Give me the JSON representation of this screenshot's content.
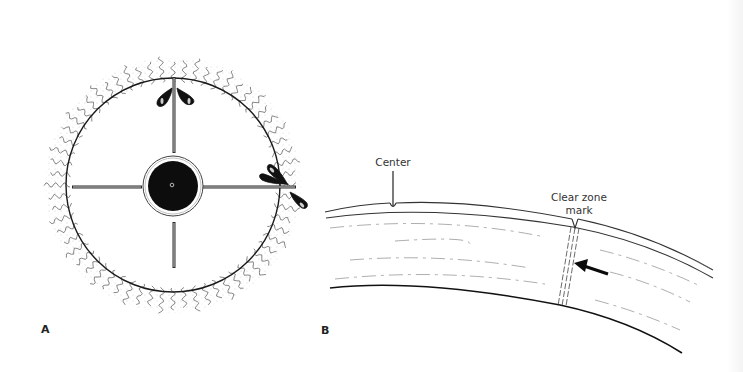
{
  "figure": {
    "panels": [
      {
        "id": "A",
        "label": "A",
        "description": "Top view of circular lens/disc with central black hub, four radial spokes, wavy fringe around rim, and liquid droplets at spoke ends"
      },
      {
        "id": "B",
        "label": "B",
        "description": "Cross-section of curved surface layers showing center mark and clear zone mark with arrow"
      }
    ],
    "annotations": {
      "center": "Center",
      "clear_zone_line1": "Clear zone",
      "clear_zone_line2": "mark"
    },
    "colors": {
      "ink": "#1a1a1a",
      "stipple": "#8a8a8a",
      "background": "#ffffff"
    }
  }
}
